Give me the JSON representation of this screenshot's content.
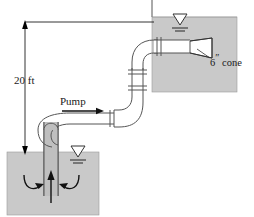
{
  "figure": {
    "labels": {
      "height": "20 ft",
      "pump": "Pump",
      "cone_number": "6",
      "cone_unit": "″",
      "cone_text": "cone",
      "cone_full": "6″ cone"
    },
    "colors": {
      "water_fill": "#c9c9c9",
      "pipe_stroke": "#555555",
      "pipe_fill": "#ffffff",
      "suction_fill": "#bfbfbf",
      "line": "#000000",
      "cone_fill": "#ffffff",
      "text": "#1a1a1a",
      "background": "#ffffff"
    },
    "dimension": {
      "value": "20 ft",
      "from": "lower reservoir free surface",
      "to": "upper reservoir free surface",
      "arrowheads": "both"
    },
    "components": [
      {
        "name": "upper-reservoir",
        "type": "water-body"
      },
      {
        "name": "lower-reservoir",
        "type": "water-body"
      },
      {
        "name": "upper-water-surface-symbol",
        "type": "free-surface-symbol"
      },
      {
        "name": "lower-water-surface-symbol",
        "type": "free-surface-symbol"
      },
      {
        "name": "pump-volute",
        "type": "pump"
      },
      {
        "name": "suction-pipe",
        "type": "pipe"
      },
      {
        "name": "discharge-pipe",
        "type": "pipe"
      },
      {
        "name": "vertical-riser",
        "type": "pipe"
      },
      {
        "name": "upper-horizontal-pipe",
        "type": "pipe"
      },
      {
        "name": "lower-elbow",
        "type": "elbow"
      },
      {
        "name": "upper-elbow",
        "type": "elbow"
      },
      {
        "name": "cone-diffuser",
        "type": "nozzle"
      },
      {
        "name": "flow-arrow-discharge",
        "type": "arrow"
      },
      {
        "name": "flow-arrow-suction-up",
        "type": "arrow"
      },
      {
        "name": "flow-arrow-intake-left",
        "type": "arrow"
      },
      {
        "name": "flow-arrow-intake-right",
        "type": "arrow"
      }
    ]
  }
}
